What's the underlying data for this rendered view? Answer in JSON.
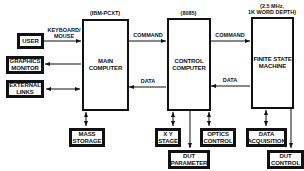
{
  "nodes": {
    "user": "USER",
    "graphics_monitor": "GRAPHICS\nMONITOR",
    "external_links": "EXTERNAL\nLINKS",
    "main_computer": "MAIN\nCOMPUTER",
    "control_computer": "CONTROL\nCOMPUTER",
    "finite_state_machine": "FINITE STATE\nMACHINE",
    "mass_storage": "MASS\nSTORAGE",
    "xy_stage": "X Y\nSTAGE",
    "optics_control": "OPTICS\nCONTROL",
    "dut_parameter": "DUT\nPARAMETER",
    "data_acquisition": "DATA\nACQUISITION",
    "dut_control": "DUT\nCONTROL"
  },
  "captions": {
    "main_computer_model": "(IBM-PCXT)",
    "control_computer_model": "(8085)",
    "fsm_spec": "(2.5 MHz,\n1K WORD DEPTH)",
    "keyboard_mouse": "KEYBOARD/\nMOUSE",
    "command_left": "COMMAND",
    "data_left": "DATA",
    "command_right": "COMMAND",
    "data_right": "DATA"
  },
  "edges": [
    {
      "from": "user",
      "to": "main_computer",
      "label": "KEYBOARD/MOUSE",
      "direction": "forward"
    },
    {
      "from": "main_computer",
      "to": "graphics_monitor",
      "direction": "forward"
    },
    {
      "from": "external_links",
      "to": "main_computer",
      "direction": "both"
    },
    {
      "from": "main_computer",
      "to": "mass_storage",
      "direction": "both"
    },
    {
      "from": "main_computer",
      "to": "control_computer",
      "label": "COMMAND",
      "direction": "forward"
    },
    {
      "from": "control_computer",
      "to": "main_computer",
      "label": "DATA",
      "direction": "forward"
    },
    {
      "from": "control_computer",
      "to": "finite_state_machine",
      "label": "COMMAND",
      "direction": "forward"
    },
    {
      "from": "finite_state_machine",
      "to": "control_computer",
      "label": "DATA",
      "direction": "forward"
    },
    {
      "from": "control_computer",
      "to": "xy_stage",
      "direction": "both"
    },
    {
      "from": "control_computer",
      "to": "dut_parameter",
      "direction": "forward"
    },
    {
      "from": "control_computer",
      "to": "optics_control",
      "direction": "both"
    },
    {
      "from": "finite_state_machine",
      "to": "data_acquisition",
      "direction": "both"
    },
    {
      "from": "finite_state_machine",
      "to": "dut_control",
      "direction": "forward"
    }
  ]
}
